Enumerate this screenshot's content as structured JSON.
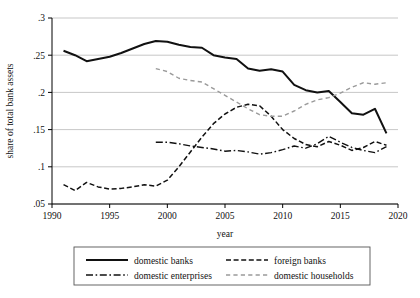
{
  "chart_data": {
    "type": "line",
    "title": "",
    "xlabel": "year",
    "ylabel": "share of total bank assets",
    "xlim": [
      1990,
      2020
    ],
    "ylim": [
      0.05,
      0.3
    ],
    "grid": true,
    "legend_position": "bottom",
    "xticks": [
      "1990",
      "1995",
      "2000",
      "2005",
      "2010",
      "2015",
      "2020"
    ],
    "xtick_values": [
      1990,
      1995,
      2000,
      2005,
      2010,
      2015,
      2020
    ],
    "yticks": [
      ".05",
      ".1",
      ".15",
      ".2",
      ".25",
      ".3"
    ],
    "ytick_values": [
      0.05,
      0.1,
      0.15,
      0.2,
      0.25,
      0.3
    ],
    "series": [
      {
        "name": "domestic banks",
        "style": "solid",
        "color": "#111111",
        "width": 2.0,
        "x": [
          1991,
          1992,
          1993,
          1994,
          1995,
          1996,
          1997,
          1998,
          1999,
          2000,
          2001,
          2002,
          2003,
          2004,
          2005,
          2006,
          2007,
          2008,
          2009,
          2010,
          2011,
          2012,
          2013,
          2014,
          2015,
          2016,
          2017,
          2018,
          2019
        ],
        "values": [
          0.256,
          0.25,
          0.242,
          0.245,
          0.248,
          0.253,
          0.259,
          0.265,
          0.269,
          0.268,
          0.264,
          0.261,
          0.26,
          0.25,
          0.247,
          0.245,
          0.232,
          0.229,
          0.231,
          0.228,
          0.21,
          0.203,
          0.2,
          0.202,
          0.187,
          0.172,
          0.17,
          0.178,
          0.145
        ]
      },
      {
        "name": "foreign banks",
        "style": "dashed",
        "color": "#111111",
        "width": 1.5,
        "x": [
          1991,
          1992,
          1993,
          1994,
          1995,
          1996,
          1997,
          1998,
          1999,
          2000,
          2001,
          2002,
          2003,
          2004,
          2005,
          2006,
          2007,
          2008,
          2009,
          2010,
          2011,
          2012,
          2013,
          2014,
          2015,
          2016,
          2017,
          2018,
          2019
        ],
        "values": [
          0.076,
          0.068,
          0.079,
          0.073,
          0.07,
          0.071,
          0.073,
          0.076,
          0.074,
          0.082,
          0.1,
          0.12,
          0.14,
          0.158,
          0.171,
          0.18,
          0.184,
          0.182,
          0.168,
          0.15,
          0.138,
          0.13,
          0.127,
          0.134,
          0.129,
          0.122,
          0.126,
          0.134,
          0.129
        ]
      },
      {
        "name": "domestic enterprises",
        "style": "dashdot",
        "color": "#111111",
        "width": 1.4,
        "x": [
          1999,
          2000,
          2001,
          2002,
          2003,
          2004,
          2005,
          2006,
          2007,
          2008,
          2009,
          2010,
          2011,
          2012,
          2013,
          2014,
          2015,
          2016,
          2017,
          2018,
          2019
        ],
        "values": [
          0.133,
          0.133,
          0.131,
          0.128,
          0.126,
          0.124,
          0.121,
          0.122,
          0.12,
          0.117,
          0.119,
          0.123,
          0.128,
          0.125,
          0.131,
          0.141,
          0.133,
          0.126,
          0.122,
          0.119,
          0.127
        ]
      },
      {
        "name": "domestic households",
        "style": "dashed-light",
        "color": "#9a9a9a",
        "width": 1.4,
        "x": [
          1999,
          2000,
          2001,
          2002,
          2003,
          2004,
          2005,
          2006,
          2007,
          2008,
          2009,
          2010,
          2011,
          2012,
          2013,
          2014,
          2015,
          2016,
          2017,
          2018,
          2019
        ],
        "values": [
          0.232,
          0.228,
          0.219,
          0.216,
          0.214,
          0.205,
          0.196,
          0.187,
          0.178,
          0.17,
          0.168,
          0.168,
          0.175,
          0.184,
          0.19,
          0.193,
          0.199,
          0.207,
          0.213,
          0.211,
          0.213
        ]
      }
    ]
  },
  "legend": {
    "entries": [
      {
        "label": "domestic banks",
        "style": "solid"
      },
      {
        "label": "foreign banks",
        "style": "dashed"
      },
      {
        "label": "domestic enterprises",
        "style": "dashdot"
      },
      {
        "label": "domestic households",
        "style": "dashed-light"
      }
    ]
  }
}
